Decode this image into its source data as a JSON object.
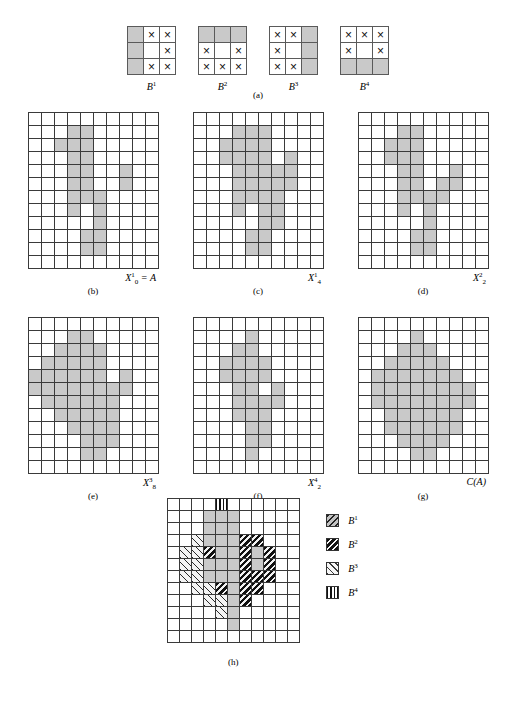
{
  "figure": {
    "caption_a": "(a)",
    "caption_h": "(h)"
  },
  "structuring_elements": [
    {
      "name": "B1",
      "label_base": "B",
      "label_sup": "1",
      "cells": [
        {
          "fill": "gray",
          "mark": ""
        },
        {
          "fill": "white",
          "mark": "×"
        },
        {
          "fill": "white",
          "mark": "×"
        },
        {
          "fill": "gray",
          "mark": ""
        },
        {
          "fill": "white",
          "mark": ""
        },
        {
          "fill": "white",
          "mark": "×"
        },
        {
          "fill": "gray",
          "mark": ""
        },
        {
          "fill": "white",
          "mark": "×"
        },
        {
          "fill": "white",
          "mark": "×"
        }
      ]
    },
    {
      "name": "B2",
      "label_base": "B",
      "label_sup": "2",
      "cells": [
        {
          "fill": "gray",
          "mark": ""
        },
        {
          "fill": "gray",
          "mark": ""
        },
        {
          "fill": "gray",
          "mark": ""
        },
        {
          "fill": "white",
          "mark": "×"
        },
        {
          "fill": "white",
          "mark": ""
        },
        {
          "fill": "white",
          "mark": "×"
        },
        {
          "fill": "white",
          "mark": "×"
        },
        {
          "fill": "white",
          "mark": "×"
        },
        {
          "fill": "white",
          "mark": "×"
        }
      ]
    },
    {
      "name": "B3",
      "label_base": "B",
      "label_sup": "3",
      "cells": [
        {
          "fill": "white",
          "mark": "×"
        },
        {
          "fill": "white",
          "mark": "×"
        },
        {
          "fill": "gray",
          "mark": ""
        },
        {
          "fill": "white",
          "mark": "×"
        },
        {
          "fill": "white",
          "mark": ""
        },
        {
          "fill": "gray",
          "mark": ""
        },
        {
          "fill": "white",
          "mark": "×"
        },
        {
          "fill": "white",
          "mark": "×"
        },
        {
          "fill": "gray",
          "mark": ""
        }
      ]
    },
    {
      "name": "B4",
      "label_base": "B",
      "label_sup": "4",
      "cells": [
        {
          "fill": "white",
          "mark": "×"
        },
        {
          "fill": "white",
          "mark": "×"
        },
        {
          "fill": "white",
          "mark": "×"
        },
        {
          "fill": "white",
          "mark": "×"
        },
        {
          "fill": "white",
          "mark": ""
        },
        {
          "fill": "white",
          "mark": "×"
        },
        {
          "fill": "gray",
          "mark": ""
        },
        {
          "fill": "gray",
          "mark": ""
        },
        {
          "fill": "gray",
          "mark": ""
        }
      ]
    }
  ],
  "grid": {
    "cols": 10,
    "rows": 12
  },
  "panels": [
    {
      "id": "b",
      "caption": "(b)",
      "label_html": "X<sup>1</sup><sub>0</sub> = A",
      "label_text": "X10 = A",
      "filled": [
        [
          1,
          3
        ],
        [
          1,
          4
        ],
        [
          2,
          2
        ],
        [
          2,
          3
        ],
        [
          2,
          4
        ],
        [
          3,
          3
        ],
        [
          3,
          4
        ],
        [
          4,
          3
        ],
        [
          4,
          4
        ],
        [
          4,
          7
        ],
        [
          5,
          3
        ],
        [
          5,
          4
        ],
        [
          5,
          7
        ],
        [
          6,
          3
        ],
        [
          6,
          4
        ],
        [
          6,
          5
        ],
        [
          7,
          3
        ],
        [
          7,
          5
        ],
        [
          8,
          5
        ],
        [
          9,
          4
        ],
        [
          9,
          5
        ],
        [
          10,
          4
        ],
        [
          10,
          5
        ]
      ]
    },
    {
      "id": "c",
      "caption": "(c)",
      "label_html": "X<sup>1</sup><sub>4</sub>",
      "label_text": "X14",
      "filled": [
        [
          1,
          3
        ],
        [
          1,
          4
        ],
        [
          1,
          5
        ],
        [
          2,
          2
        ],
        [
          2,
          3
        ],
        [
          2,
          4
        ],
        [
          2,
          5
        ],
        [
          3,
          2
        ],
        [
          3,
          3
        ],
        [
          3,
          4
        ],
        [
          3,
          5
        ],
        [
          3,
          7
        ],
        [
          4,
          3
        ],
        [
          4,
          4
        ],
        [
          4,
          5
        ],
        [
          4,
          6
        ],
        [
          4,
          7
        ],
        [
          5,
          3
        ],
        [
          5,
          4
        ],
        [
          5,
          5
        ],
        [
          5,
          6
        ],
        [
          5,
          7
        ],
        [
          6,
          3
        ],
        [
          6,
          4
        ],
        [
          6,
          5
        ],
        [
          6,
          6
        ],
        [
          7,
          3
        ],
        [
          7,
          5
        ],
        [
          7,
          6
        ],
        [
          8,
          5
        ],
        [
          8,
          6
        ],
        [
          9,
          4
        ],
        [
          9,
          5
        ],
        [
          10,
          4
        ],
        [
          10,
          5
        ]
      ]
    },
    {
      "id": "d",
      "caption": "(d)",
      "label_html": "X<sup>2</sup><sub>2</sub>",
      "label_text": "X22",
      "filled": [
        [
          1,
          3
        ],
        [
          1,
          4
        ],
        [
          2,
          2
        ],
        [
          2,
          3
        ],
        [
          2,
          4
        ],
        [
          3,
          2
        ],
        [
          3,
          3
        ],
        [
          3,
          4
        ],
        [
          4,
          3
        ],
        [
          4,
          4
        ],
        [
          4,
          7
        ],
        [
          5,
          3
        ],
        [
          5,
          4
        ],
        [
          5,
          6
        ],
        [
          5,
          7
        ],
        [
          6,
          3
        ],
        [
          6,
          4
        ],
        [
          6,
          5
        ],
        [
          6,
          6
        ],
        [
          7,
          3
        ],
        [
          7,
          5
        ],
        [
          8,
          5
        ],
        [
          9,
          4
        ],
        [
          9,
          5
        ],
        [
          10,
          4
        ],
        [
          10,
          5
        ]
      ]
    },
    {
      "id": "e",
      "caption": "(e)",
      "label_html": "X<sup>3</sup><sub>8</sub>",
      "label_text": "X38",
      "filled": [
        [
          1,
          3
        ],
        [
          1,
          4
        ],
        [
          2,
          2
        ],
        [
          2,
          3
        ],
        [
          2,
          4
        ],
        [
          2,
          5
        ],
        [
          3,
          1
        ],
        [
          3,
          2
        ],
        [
          3,
          3
        ],
        [
          3,
          4
        ],
        [
          3,
          5
        ],
        [
          4,
          0
        ],
        [
          4,
          1
        ],
        [
          4,
          2
        ],
        [
          4,
          3
        ],
        [
          4,
          4
        ],
        [
          4,
          5
        ],
        [
          4,
          7
        ],
        [
          5,
          0
        ],
        [
          5,
          1
        ],
        [
          5,
          2
        ],
        [
          5,
          3
        ],
        [
          5,
          4
        ],
        [
          5,
          5
        ],
        [
          5,
          6
        ],
        [
          5,
          7
        ],
        [
          6,
          1
        ],
        [
          6,
          2
        ],
        [
          6,
          3
        ],
        [
          6,
          4
        ],
        [
          6,
          5
        ],
        [
          6,
          6
        ],
        [
          7,
          2
        ],
        [
          7,
          3
        ],
        [
          7,
          4
        ],
        [
          7,
          5
        ],
        [
          7,
          6
        ],
        [
          8,
          3
        ],
        [
          8,
          4
        ],
        [
          8,
          5
        ],
        [
          8,
          6
        ],
        [
          9,
          4
        ],
        [
          9,
          5
        ],
        [
          9,
          6
        ],
        [
          10,
          4
        ],
        [
          10,
          5
        ]
      ]
    },
    {
      "id": "f",
      "caption": "(f)",
      "label_html": "X<sup>4</sup><sub>2</sub>",
      "label_text": "X42",
      "filled": [
        [
          1,
          4
        ],
        [
          2,
          3
        ],
        [
          2,
          4
        ],
        [
          3,
          2
        ],
        [
          3,
          3
        ],
        [
          3,
          4
        ],
        [
          3,
          5
        ],
        [
          4,
          2
        ],
        [
          4,
          3
        ],
        [
          4,
          4
        ],
        [
          4,
          5
        ],
        [
          5,
          3
        ],
        [
          5,
          4
        ],
        [
          5,
          6
        ],
        [
          6,
          3
        ],
        [
          6,
          4
        ],
        [
          6,
          5
        ],
        [
          6,
          6
        ],
        [
          7,
          3
        ],
        [
          7,
          4
        ],
        [
          7,
          5
        ],
        [
          8,
          4
        ],
        [
          8,
          5
        ],
        [
          9,
          4
        ],
        [
          9,
          5
        ],
        [
          10,
          4
        ]
      ]
    },
    {
      "id": "g",
      "caption": "(g)",
      "label_html": "C(A)",
      "label_text": "C(A)",
      "filled": [
        [
          1,
          4
        ],
        [
          2,
          3
        ],
        [
          2,
          4
        ],
        [
          2,
          5
        ],
        [
          3,
          2
        ],
        [
          3,
          3
        ],
        [
          3,
          4
        ],
        [
          3,
          5
        ],
        [
          3,
          6
        ],
        [
          4,
          1
        ],
        [
          4,
          2
        ],
        [
          4,
          3
        ],
        [
          4,
          4
        ],
        [
          4,
          5
        ],
        [
          4,
          6
        ],
        [
          4,
          7
        ],
        [
          5,
          1
        ],
        [
          5,
          2
        ],
        [
          5,
          3
        ],
        [
          5,
          4
        ],
        [
          5,
          5
        ],
        [
          5,
          6
        ],
        [
          5,
          7
        ],
        [
          5,
          8
        ],
        [
          6,
          1
        ],
        [
          6,
          2
        ],
        [
          6,
          3
        ],
        [
          6,
          4
        ],
        [
          6,
          5
        ],
        [
          6,
          6
        ],
        [
          6,
          7
        ],
        [
          6,
          8
        ],
        [
          7,
          2
        ],
        [
          7,
          3
        ],
        [
          7,
          4
        ],
        [
          7,
          5
        ],
        [
          7,
          6
        ],
        [
          7,
          7
        ],
        [
          8,
          2
        ],
        [
          8,
          3
        ],
        [
          8,
          4
        ],
        [
          8,
          5
        ],
        [
          8,
          6
        ],
        [
          8,
          7
        ],
        [
          9,
          3
        ],
        [
          9,
          4
        ],
        [
          9,
          5
        ],
        [
          9,
          6
        ],
        [
          10,
          4
        ],
        [
          10,
          5
        ]
      ]
    }
  ],
  "panel_h": {
    "caption": "(h)",
    "grid": {
      "cols": 11,
      "rows": 12
    },
    "cells": [
      {
        "r": 0,
        "c": 4,
        "type": "b4"
      },
      {
        "r": 1,
        "c": 3,
        "type": "g"
      },
      {
        "r": 1,
        "c": 4,
        "type": "g"
      },
      {
        "r": 1,
        "c": 5,
        "type": "g"
      },
      {
        "r": 2,
        "c": 3,
        "type": "g"
      },
      {
        "r": 2,
        "c": 4,
        "type": "g"
      },
      {
        "r": 2,
        "c": 5,
        "type": "g"
      },
      {
        "r": 3,
        "c": 2,
        "type": "b3"
      },
      {
        "r": 3,
        "c": 3,
        "type": "g"
      },
      {
        "r": 3,
        "c": 4,
        "type": "g"
      },
      {
        "r": 3,
        "c": 5,
        "type": "g"
      },
      {
        "r": 3,
        "c": 6,
        "type": "b2"
      },
      {
        "r": 3,
        "c": 7,
        "type": "b2"
      },
      {
        "r": 4,
        "c": 1,
        "type": "b3"
      },
      {
        "r": 4,
        "c": 2,
        "type": "b3"
      },
      {
        "r": 4,
        "c": 3,
        "type": "b2"
      },
      {
        "r": 4,
        "c": 4,
        "type": "g"
      },
      {
        "r": 4,
        "c": 5,
        "type": "g"
      },
      {
        "r": 4,
        "c": 6,
        "type": "b2"
      },
      {
        "r": 4,
        "c": 7,
        "type": "g"
      },
      {
        "r": 4,
        "c": 8,
        "type": "b2"
      },
      {
        "r": 5,
        "c": 1,
        "type": "b3"
      },
      {
        "r": 5,
        "c": 2,
        "type": "b3"
      },
      {
        "r": 5,
        "c": 3,
        "type": "g"
      },
      {
        "r": 5,
        "c": 4,
        "type": "g"
      },
      {
        "r": 5,
        "c": 5,
        "type": "g"
      },
      {
        "r": 5,
        "c": 6,
        "type": "b2"
      },
      {
        "r": 5,
        "c": 7,
        "type": "g"
      },
      {
        "r": 5,
        "c": 8,
        "type": "b2"
      },
      {
        "r": 6,
        "c": 1,
        "type": "b3"
      },
      {
        "r": 6,
        "c": 2,
        "type": "b3"
      },
      {
        "r": 6,
        "c": 3,
        "type": "g"
      },
      {
        "r": 6,
        "c": 4,
        "type": "g"
      },
      {
        "r": 6,
        "c": 5,
        "type": "g"
      },
      {
        "r": 6,
        "c": 6,
        "type": "b2"
      },
      {
        "r": 6,
        "c": 7,
        "type": "b2"
      },
      {
        "r": 6,
        "c": 8,
        "type": "b2"
      },
      {
        "r": 7,
        "c": 2,
        "type": "b3"
      },
      {
        "r": 7,
        "c": 3,
        "type": "b3"
      },
      {
        "r": 7,
        "c": 4,
        "type": "b2"
      },
      {
        "r": 7,
        "c": 5,
        "type": "g"
      },
      {
        "r": 7,
        "c": 6,
        "type": "b2"
      },
      {
        "r": 7,
        "c": 7,
        "type": "b2"
      },
      {
        "r": 8,
        "c": 3,
        "type": "b3"
      },
      {
        "r": 8,
        "c": 4,
        "type": "b3"
      },
      {
        "r": 8,
        "c": 5,
        "type": "g"
      },
      {
        "r": 8,
        "c": 6,
        "type": "b2"
      },
      {
        "r": 9,
        "c": 4,
        "type": "b3"
      },
      {
        "r": 9,
        "c": 5,
        "type": "g"
      },
      {
        "r": 10,
        "c": 5,
        "type": "g"
      }
    ]
  },
  "legend": {
    "items": [
      {
        "swatch": "s1",
        "base": "B",
        "sup": "1",
        "name": "B1"
      },
      {
        "swatch": "s2",
        "base": "B",
        "sup": "2",
        "name": "B2"
      },
      {
        "swatch": "s3",
        "base": "B",
        "sup": "3",
        "name": "B3"
      },
      {
        "swatch": "s4",
        "base": "B",
        "sup": "4",
        "name": "B4"
      }
    ]
  }
}
